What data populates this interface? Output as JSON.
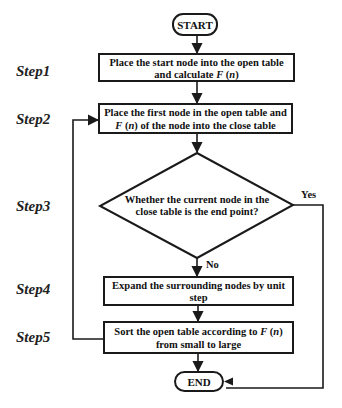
{
  "diagram": {
    "type": "flowchart",
    "colors": {
      "stroke": "#1a1a1a",
      "text": "#111111",
      "background": "#ffffff"
    },
    "start": {
      "label": "START"
    },
    "end": {
      "label": "END"
    },
    "steps": [
      {
        "id": "step1",
        "label": "Step1",
        "shape": "rectangle",
        "lines": [
          "Place the start node into the open table",
          "and calculate ",
          "F",
          " (",
          "n",
          ")"
        ],
        "line1": "Place the start node into the open table",
        "line2_prefix": "and calculate ",
        "line2_F": "F",
        "line2_open": " (",
        "line2_n": "n",
        "line2_close": ")"
      },
      {
        "id": "step2",
        "label": "Step2",
        "shape": "rectangle",
        "line1": "Place the first node in the open table and",
        "line2_F": "F",
        "line2_open": " (",
        "line2_n": "n",
        "line2_rest": ") of the node  into the close table"
      },
      {
        "id": "step3",
        "label": "Step3",
        "shape": "diamond",
        "line1": "Whether the current node in the",
        "line2": "close table is the end point?"
      },
      {
        "id": "step4",
        "label": "Step4",
        "shape": "rectangle",
        "line1": "Expand the surrounding nodes by unit",
        "line2": "step"
      },
      {
        "id": "step5",
        "label": "Step5",
        "shape": "rectangle",
        "line1_prefix": "Sort the open table according to ",
        "line1_F": "F",
        "line1_open": " (",
        "line1_n": "n",
        "line1_close": ")",
        "line2": "from small to large"
      }
    ],
    "edges": {
      "yes_label": "Yes",
      "no_label": "No"
    }
  }
}
